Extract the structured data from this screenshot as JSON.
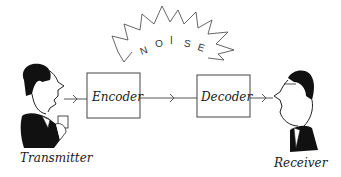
{
  "diagram": {
    "type": "communication-model",
    "noise": {
      "label": "NOISE",
      "letters": [
        "N",
        "O",
        "I",
        "S",
        "E"
      ]
    },
    "nodes": [
      {
        "id": "transmitter",
        "label": "Transmitter",
        "kind": "person"
      },
      {
        "id": "encoder",
        "label": "Encoder",
        "kind": "box"
      },
      {
        "id": "decoder",
        "label": "Decoder",
        "kind": "box"
      },
      {
        "id": "receiver",
        "label": "Receiver",
        "kind": "person"
      }
    ],
    "edges": [
      {
        "from": "transmitter",
        "to": "encoder"
      },
      {
        "from": "encoder",
        "to": "decoder"
      },
      {
        "from": "decoder",
        "to": "receiver"
      }
    ],
    "colors": {
      "ink": "#1a1a1a",
      "line": "#444444",
      "background": "#ffffff"
    }
  }
}
